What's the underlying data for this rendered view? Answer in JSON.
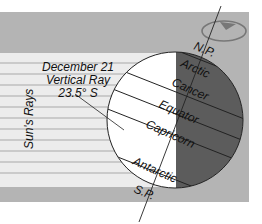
{
  "diagram": {
    "title_lines": [
      "December 21",
      "Vertical Ray",
      "23.5° S"
    ],
    "rays_label": "Sun's Rays",
    "pole_labels": {
      "north": "N.P.",
      "south": "S.P."
    },
    "latitude_labels": {
      "arctic": "Arctic",
      "cancer": "Cancer",
      "equator": "Equator",
      "capricorn": "Capricorn",
      "antarctic": "Antarctic"
    },
    "colors": {
      "panel": "#b4b4b4",
      "rays_band": "#ececec",
      "ray_lines": "#a8a8a8",
      "globe_day": "#ffffff",
      "globe_night": "#5c5c5c",
      "lines": "#222222"
    }
  }
}
